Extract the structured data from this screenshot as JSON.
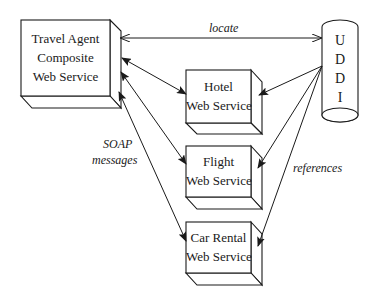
{
  "diagram": {
    "nodes": {
      "travel_agent": {
        "lines": [
          "Travel Agent",
          "Composite",
          "Web Service"
        ]
      },
      "hotel": {
        "lines": [
          "Hotel",
          "Web Service"
        ]
      },
      "flight": {
        "lines": [
          "Flight",
          "Web Service"
        ]
      },
      "car_rental": {
        "lines": [
          "Car Rental",
          "Web Service"
        ]
      },
      "uddi": {
        "letters": [
          "U",
          "D",
          "D",
          "I"
        ]
      }
    },
    "edge_labels": {
      "locate": "locate",
      "soap_line1": "SOAP",
      "soap_line2": "messages",
      "references": "references"
    },
    "edges": [
      {
        "from": "travel_agent",
        "to": "uddi",
        "label": "locate",
        "direction": "bidirectional"
      },
      {
        "from": "travel_agent",
        "to": "hotel",
        "label": "SOAP messages",
        "direction": "bidirectional"
      },
      {
        "from": "travel_agent",
        "to": "flight",
        "label": "SOAP messages",
        "direction": "bidirectional"
      },
      {
        "from": "travel_agent",
        "to": "car_rental",
        "label": "SOAP messages",
        "direction": "bidirectional"
      },
      {
        "from": "uddi",
        "to": "hotel",
        "label": "references",
        "direction": "forward"
      },
      {
        "from": "uddi",
        "to": "flight",
        "label": "references",
        "direction": "forward"
      },
      {
        "from": "uddi",
        "to": "car_rental",
        "label": "references",
        "direction": "forward"
      }
    ],
    "colors": {
      "stroke": "#1a1a1a",
      "background": "#ffffff"
    }
  }
}
